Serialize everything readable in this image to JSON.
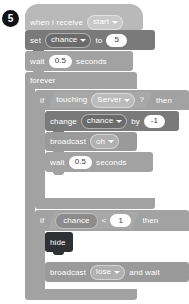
{
  "badge": {
    "number": "5"
  },
  "script": {
    "blocks": [
      {
        "id": "when-i-receive",
        "kind": "hat",
        "label": "when I receive",
        "dropdown": "start"
      },
      {
        "id": "set-variable",
        "kind": "stack",
        "label": "set",
        "dropdown": "chance",
        "mid_label": "to",
        "value": "5"
      },
      {
        "id": "wait-1",
        "kind": "stack",
        "label": "wait",
        "value": "0.5",
        "suffix": "seconds"
      },
      {
        "id": "forever",
        "kind": "c-block",
        "label": "forever"
      },
      {
        "id": "if-touching",
        "kind": "c-block",
        "label": "if",
        "condition_label": "touching",
        "condition_dropdown": "Server",
        "condition_q": "?",
        "then_label": "then"
      },
      {
        "id": "change-variable",
        "kind": "stack",
        "label": "change",
        "dropdown": "chance",
        "mid_label": "by",
        "value": "-1"
      },
      {
        "id": "broadcast-oh",
        "kind": "stack",
        "label": "broadcast",
        "dropdown": "oh"
      },
      {
        "id": "wait-2",
        "kind": "stack",
        "label": "wait",
        "value": "0.5",
        "suffix": "seconds"
      },
      {
        "id": "if-chance-less-than",
        "kind": "c-block",
        "label": "if",
        "reporter": "chance",
        "operator": "<",
        "value": "1",
        "then_label": "then"
      },
      {
        "id": "hide",
        "kind": "stack",
        "label": "hide"
      },
      {
        "id": "broadcast-lose-and-wait",
        "kind": "stack",
        "label": "broadcast",
        "dropdown": "lose",
        "suffix": "and wait"
      }
    ]
  },
  "colors": {
    "event": "#b9b9b9",
    "data": "#7a7a7a",
    "control": "#a2a2a2",
    "looks": "#2f3033",
    "message": "#9a9a9a",
    "badge_bg": "#111214"
  }
}
